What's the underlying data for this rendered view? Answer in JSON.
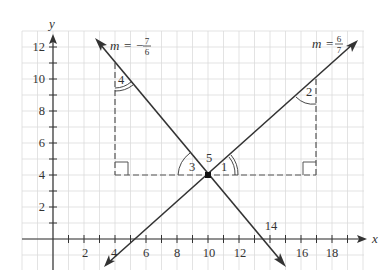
{
  "axes": {
    "x_label": "x",
    "y_label": "y",
    "x_ticks": [
      "2",
      "4",
      "6",
      "8",
      "10",
      "12",
      "16",
      "18"
    ],
    "y_ticks": [
      "2",
      "4",
      "6",
      "8",
      "10",
      "12"
    ],
    "x_extra_label": "14"
  },
  "lines": [
    {
      "name": "negative-slope-line",
      "slope_label_m": "m",
      "slope_label_eq": "=",
      "slope_sign": "−",
      "slope_num": "7",
      "slope_den": "6"
    },
    {
      "name": "positive-slope-line",
      "slope_label_m": "m",
      "slope_label_eq": "=",
      "slope_sign": "",
      "slope_num": "6",
      "slope_den": "7"
    }
  ],
  "angles": {
    "a1": "1",
    "a2": "2",
    "a3": "3",
    "a4": "4",
    "a5": "5"
  },
  "intersection": {
    "x": 10,
    "y": 4
  },
  "colors": {
    "grid": "#d9d9d9",
    "line": "#333333",
    "dash": "#555555"
  }
}
